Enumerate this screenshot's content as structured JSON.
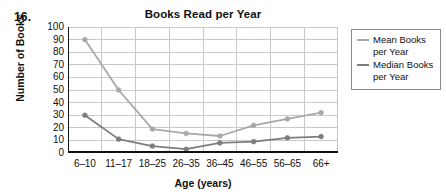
{
  "item_number": "16.",
  "chart_data": {
    "type": "line",
    "title": "Books Read per Year",
    "xlabel": "Age (years)",
    "ylabel": "Number of Books",
    "categories": [
      "6–10",
      "11–17",
      "18–25",
      "26–35",
      "36–45",
      "46–55",
      "56–65",
      "66+"
    ],
    "ylim": [
      0,
      100
    ],
    "ytick_values": [
      0,
      10,
      20,
      30,
      40,
      50,
      60,
      70,
      80,
      90,
      100
    ],
    "grid": true,
    "legend_position": "right",
    "series": [
      {
        "name": "Mean Books per Year",
        "color": "#a8a8a8",
        "values": [
          90,
          50,
          19,
          15.5,
          13.5,
          22,
          27,
          32
        ]
      },
      {
        "name": "Median Books per Year",
        "color": "#7d7d7d",
        "values": [
          30,
          11,
          5.5,
          3,
          8,
          9,
          12,
          13
        ]
      }
    ]
  },
  "legend": {
    "entries": [
      {
        "line1": "Mean Books",
        "line2": "per Year"
      },
      {
        "line1": "Median Books",
        "line2": "per Year"
      }
    ]
  },
  "colors": {
    "axis": "#111111",
    "grid": "#c9c9c9",
    "mean_line": "#a8a8a8",
    "median_line": "#7d7d7d"
  }
}
